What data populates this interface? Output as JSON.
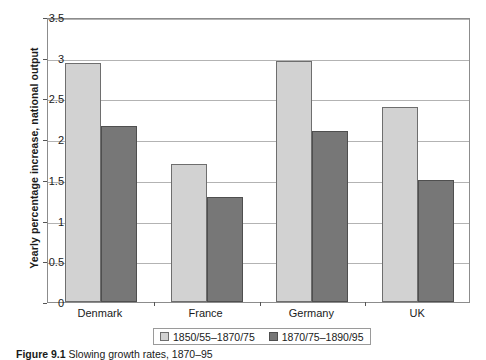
{
  "chart_data": {
    "type": "bar",
    "title": "",
    "xlabel": "",
    "ylabel": "Yearly percentage increase, national output",
    "categories": [
      "Denmark",
      "France",
      "Germany",
      "UK"
    ],
    "series": [
      {
        "name": "1850/55–1870/75",
        "color": "#d2d2d2",
        "values": [
          2.93,
          1.69,
          2.96,
          2.4
        ]
      },
      {
        "name": "1870/75–1890/95",
        "color": "#777777",
        "values": [
          2.16,
          1.29,
          2.1,
          1.5
        ]
      }
    ],
    "ylim": [
      0,
      3.5
    ],
    "yticks": [
      0,
      0.5,
      1,
      1.5,
      2,
      2.5,
      3,
      3.5
    ],
    "ytick_labels": [
      "0",
      "0.5",
      "1",
      "1.5",
      "2",
      "2.5",
      "3",
      "3.5"
    ],
    "grid": true,
    "legend_position": "bottom"
  },
  "caption": {
    "label": "Figure 9.1",
    "text": "Slowing growth rates, 1870–95"
  }
}
